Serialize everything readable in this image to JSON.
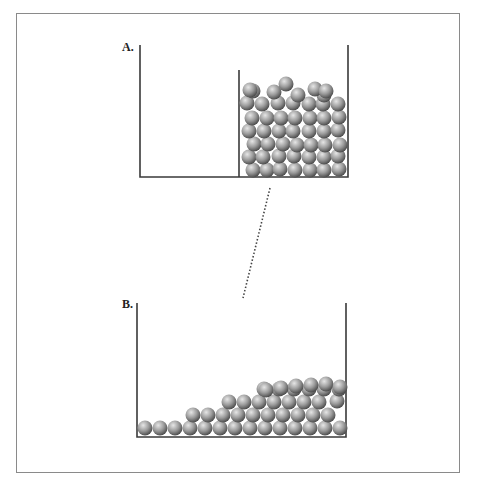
{
  "figure": {
    "panel_a": {
      "label": "A.",
      "description": "Container with a partition; all balls packed on the right side"
    },
    "panel_b": {
      "label": "B.",
      "description": "Container without partition; balls spread out along the bottom"
    },
    "connector": "dotted line linking panel A to panel B"
  },
  "colors": {
    "wall": "#3a3a3a",
    "frame": "#8a8a8a",
    "ball_light": "#e6e6e6",
    "ball_mid": "#9a9a9a",
    "ball_dark": "#4a4a4a",
    "dots": "#444444"
  },
  "geometry": {
    "ball_radius": 7.5,
    "box_a": {
      "left": 140,
      "right": 348,
      "top": 45,
      "bottom": 177,
      "partition_x": 239,
      "partition_top": 70
    },
    "box_b": {
      "left": 137,
      "right": 346,
      "top": 303,
      "bottom": 437
    },
    "connector": {
      "x1": 270,
      "y1": 188,
      "x2": 243,
      "y2": 298
    },
    "balls_a": [
      [
        253,
        170
      ],
      [
        267,
        170
      ],
      [
        280,
        169
      ],
      [
        295,
        170
      ],
      [
        310,
        170
      ],
      [
        324,
        170
      ],
      [
        339,
        169
      ],
      [
        249,
        157
      ],
      [
        263,
        157
      ],
      [
        279,
        156
      ],
      [
        294,
        156
      ],
      [
        309,
        157
      ],
      [
        324,
        157
      ],
      [
        338,
        156
      ],
      [
        254,
        144
      ],
      [
        268,
        144
      ],
      [
        283,
        144
      ],
      [
        297,
        145
      ],
      [
        311,
        145
      ],
      [
        325,
        145
      ],
      [
        340,
        145
      ],
      [
        249,
        131
      ],
      [
        264,
        131
      ],
      [
        279,
        131
      ],
      [
        293,
        131
      ],
      [
        309,
        131
      ],
      [
        324,
        131
      ],
      [
        338,
        130
      ],
      [
        252,
        118
      ],
      [
        267,
        118
      ],
      [
        281,
        118
      ],
      [
        295,
        118
      ],
      [
        310,
        118
      ],
      [
        324,
        118
      ],
      [
        339,
        117
      ],
      [
        247,
        103
      ],
      [
        262,
        104
      ],
      [
        278,
        103
      ],
      [
        293,
        103
      ],
      [
        309,
        104
      ],
      [
        323,
        104
      ],
      [
        338,
        104
      ],
      [
        253,
        91
      ],
      [
        274,
        92
      ],
      [
        298,
        95
      ],
      [
        324,
        95
      ],
      [
        250,
        90
      ],
      [
        286,
        84
      ],
      [
        315,
        89
      ],
      [
        326,
        91
      ]
    ],
    "balls_b": [
      [
        145,
        428
      ],
      [
        160,
        428
      ],
      [
        175,
        428
      ],
      [
        190,
        428
      ],
      [
        205,
        428
      ],
      [
        220,
        428
      ],
      [
        235,
        428
      ],
      [
        250,
        428
      ],
      [
        265,
        428
      ],
      [
        280,
        428
      ],
      [
        295,
        428
      ],
      [
        310,
        428
      ],
      [
        325,
        428
      ],
      [
        340,
        428
      ],
      [
        193,
        415
      ],
      [
        208,
        415
      ],
      [
        223,
        415
      ],
      [
        238,
        415
      ],
      [
        253,
        415
      ],
      [
        268,
        415
      ],
      [
        283,
        415
      ],
      [
        298,
        415
      ],
      [
        313,
        415
      ],
      [
        328,
        415
      ],
      [
        229,
        402
      ],
      [
        244,
        402
      ],
      [
        259,
        402
      ],
      [
        274,
        402
      ],
      [
        289,
        402
      ],
      [
        304,
        402
      ],
      [
        319,
        402
      ],
      [
        337,
        401
      ],
      [
        264,
        389
      ],
      [
        279,
        389
      ],
      [
        294,
        389
      ],
      [
        309,
        389
      ],
      [
        324,
        389
      ],
      [
        339,
        389
      ],
      [
        266,
        390
      ],
      [
        281,
        388
      ],
      [
        296,
        386
      ],
      [
        311,
        385
      ],
      [
        326,
        384
      ],
      [
        340,
        387
      ]
    ]
  }
}
